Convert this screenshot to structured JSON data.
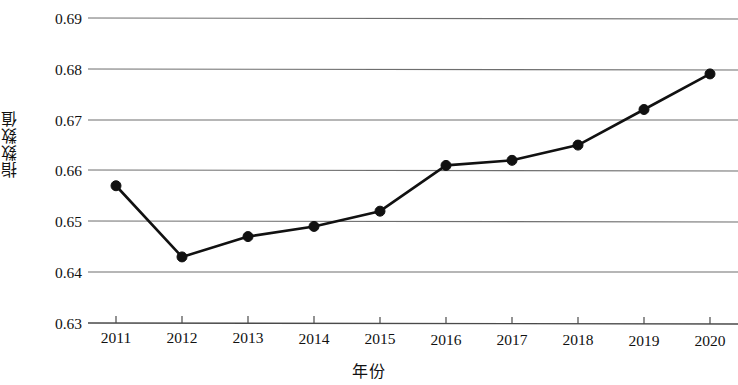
{
  "chart_data": {
    "type": "line",
    "title": "",
    "xlabel": "年份",
    "ylabel": "指数数值",
    "categories": [
      "2011",
      "2012",
      "2013",
      "2014",
      "2015",
      "2016",
      "2017",
      "2018",
      "2019",
      "2020"
    ],
    "x": [
      2011,
      2012,
      2013,
      2014,
      2015,
      2016,
      2017,
      2018,
      2019,
      2020
    ],
    "values": [
      0.657,
      0.643,
      0.647,
      0.649,
      0.652,
      0.661,
      0.662,
      0.665,
      0.672,
      0.679
    ],
    "series": [
      {
        "name": "指数数值",
        "values": [
          0.657,
          0.643,
          0.647,
          0.649,
          0.652,
          0.661,
          0.662,
          0.665,
          0.672,
          0.679
        ]
      }
    ],
    "ylim": [
      0.63,
      0.69
    ],
    "yticks": [
      0.63,
      0.64,
      0.65,
      0.66,
      0.67,
      0.68,
      0.69
    ],
    "ytick_labels": [
      "0.63",
      "0.64",
      "0.65",
      "0.66",
      "0.67",
      "0.68",
      "0.69"
    ],
    "xtick_labels": [
      "2011",
      "2012",
      "2013",
      "2014",
      "2015",
      "2016",
      "2017",
      "2018",
      "2019",
      "2020"
    ],
    "grid": "horizontal",
    "legend": "none",
    "line_color": "#111111",
    "marker": "circle",
    "marker_color": "#111111",
    "gridline_color": "#6e6e6e",
    "background_color": "#ffffff"
  }
}
